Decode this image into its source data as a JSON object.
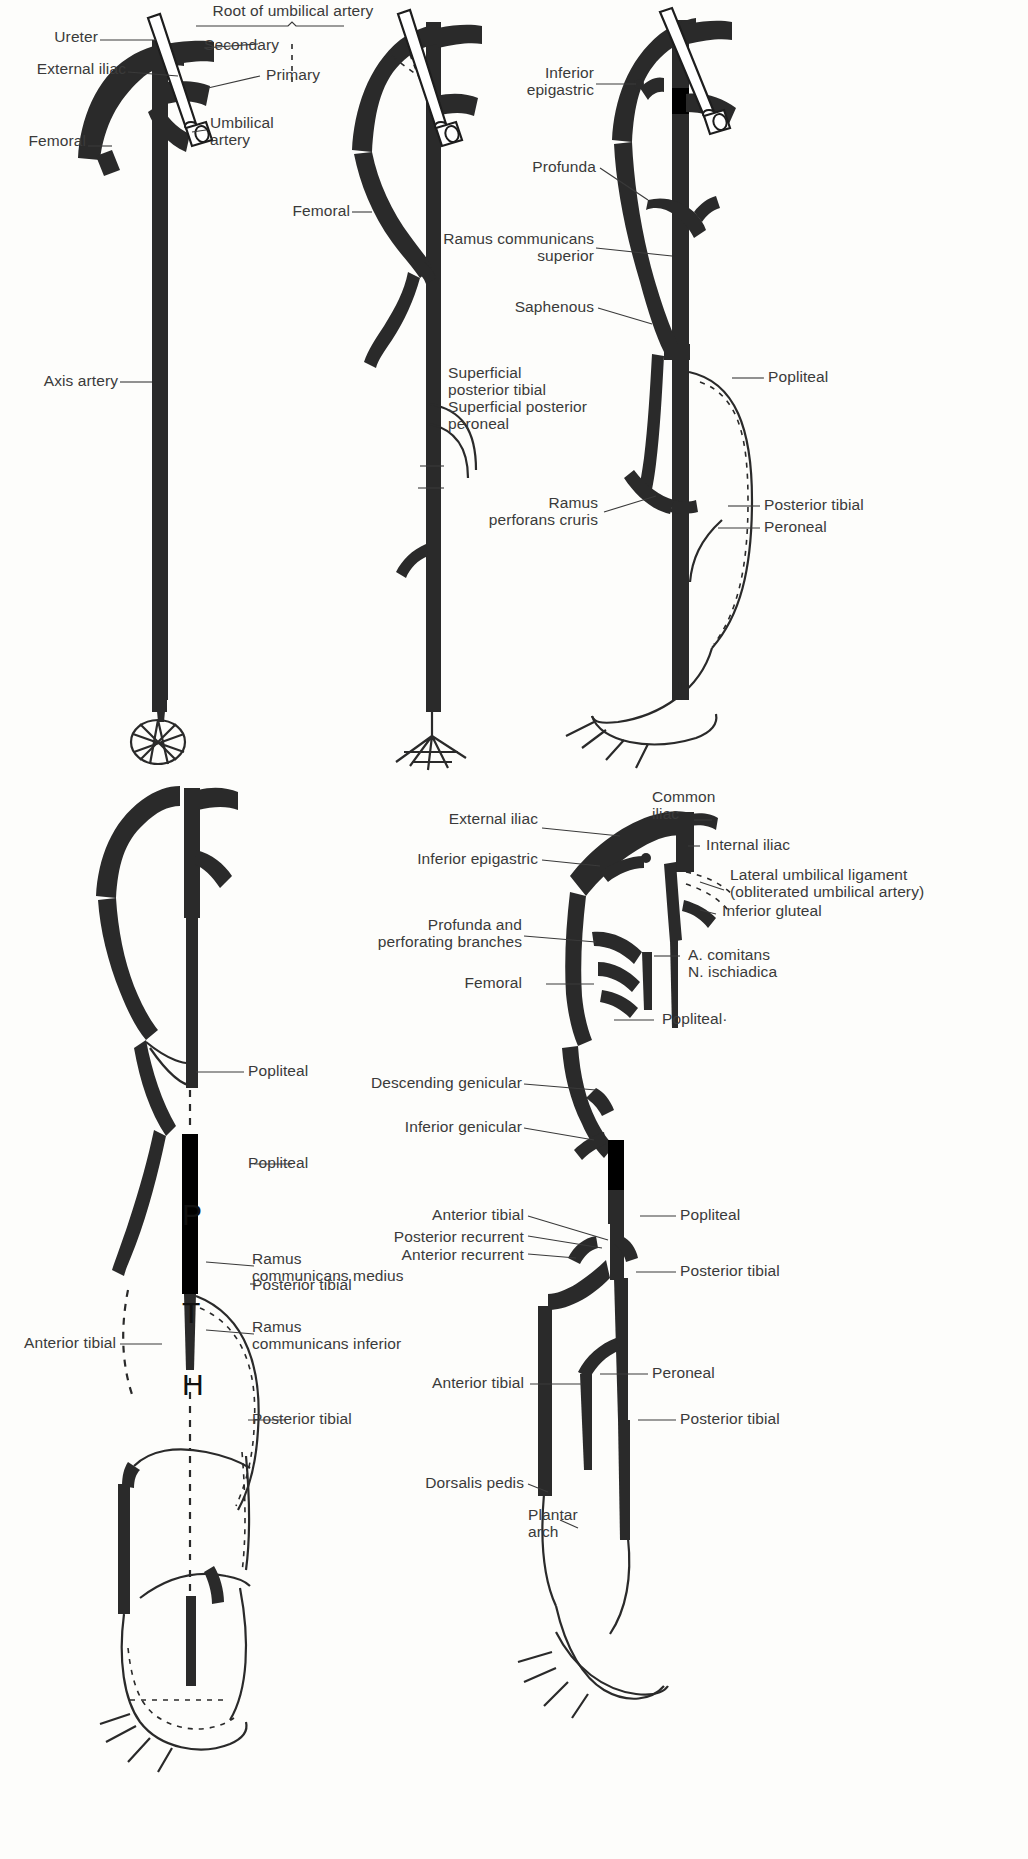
{
  "plate": {
    "title": "Development of the arteries of the lower limb",
    "ink_color": "#2a2a2a",
    "label_color": "#3a3a3a"
  },
  "panels": [
    {
      "id": "panel-1",
      "name": "axis-artery-stage",
      "labels": [
        {
          "key": "ureter",
          "text": "Ureter"
        },
        {
          "key": "external_iliac",
          "text": "External iliac"
        },
        {
          "key": "femoral",
          "text": "Femoral"
        },
        {
          "key": "axis_artery",
          "text": "Axis artery"
        },
        {
          "key": "umbilical_artery",
          "text": "Umbilical\nartery"
        },
        {
          "key": "root_of_umbilical_artery",
          "text": "Root of umbilical artery"
        },
        {
          "key": "secondary",
          "text": "Secondary"
        },
        {
          "key": "primary",
          "text": "Primary"
        }
      ]
    },
    {
      "id": "panel-2",
      "name": "superficial-branches-stage",
      "labels": [
        {
          "key": "femoral",
          "text": "Femoral"
        },
        {
          "key": "superficial_posterior_tibial",
          "text": "Superficial\nposterior tibial"
        },
        {
          "key": "superficial_posterior_peroneal",
          "text": "Superficial posterior\nperoneal"
        }
      ]
    },
    {
      "id": "panel-3",
      "name": "popliteal-stage",
      "labels": [
        {
          "key": "inferior_epigastric",
          "text": "Inferior\nepigastric"
        },
        {
          "key": "profunda",
          "text": "Profunda"
        },
        {
          "key": "ramus_communicans_superior",
          "text": "Ramus communicans\nsuperior"
        },
        {
          "key": "saphenous",
          "text": "Saphenous"
        },
        {
          "key": "ramus_perforans_cruris",
          "text": "Ramus\nperforans cruris"
        },
        {
          "key": "popliteal",
          "text": "Popliteal"
        },
        {
          "key": "posterior_tibial",
          "text": "Posterior tibial"
        },
        {
          "key": "peroneal",
          "text": "Peroneal"
        }
      ]
    },
    {
      "id": "panel-4",
      "name": "rami-communicantes-stage",
      "letters": [
        {
          "key": "p",
          "text": "P"
        },
        {
          "key": "t",
          "text": "T"
        },
        {
          "key": "h",
          "text": "H"
        }
      ],
      "labels": [
        {
          "key": "popliteal_upper",
          "text": "Popliteal"
        },
        {
          "key": "popliteal_lower",
          "text": "Popliteal"
        },
        {
          "key": "ramus_communicans_medius",
          "text": "Ramus\ncommunicans medius"
        },
        {
          "key": "posterior_tibial_upper",
          "text": "Posterior tibial"
        },
        {
          "key": "ramus_communicans_inferior",
          "text": "Ramus\ncommunicans inferior"
        },
        {
          "key": "anterior_tibial",
          "text": "Anterior tibial"
        },
        {
          "key": "posterior_tibial_lower",
          "text": "Posterior tibial"
        }
      ]
    },
    {
      "id": "panel-5",
      "name": "adult-pattern",
      "labels": [
        {
          "key": "external_iliac",
          "text": "External iliac"
        },
        {
          "key": "common_iliac",
          "text": "Common\niliac"
        },
        {
          "key": "inferior_epigastric",
          "text": "Inferior epigastric"
        },
        {
          "key": "internal_iliac",
          "text": "Internal iliac"
        },
        {
          "key": "lateral_umbilical_ligament",
          "text": "Lateral umbilical ligament\n(obliterated umbilical artery)"
        },
        {
          "key": "inferior_gluteal",
          "text": "Inferior gluteal"
        },
        {
          "key": "profunda_and_perforating",
          "text": "Profunda and\nperforating branches"
        },
        {
          "key": "a_comitans_n_ischiadica",
          "text": "A. comitans\nN. ischiadica"
        },
        {
          "key": "femoral",
          "text": "Femoral"
        },
        {
          "key": "popliteal_top",
          "text": "Popliteal·"
        },
        {
          "key": "descending_genicular",
          "text": "Descending genicular"
        },
        {
          "key": "inferior_genicular",
          "text": "Inferior genicular"
        },
        {
          "key": "anterior_tibial_upper",
          "text": "Anterior tibial"
        },
        {
          "key": "posterior_recurrent",
          "text": "Posterior recurrent"
        },
        {
          "key": "anterior_recurrent",
          "text": "Anterior recurrent"
        },
        {
          "key": "popliteal_right",
          "text": "Popliteal"
        },
        {
          "key": "posterior_tibial_right",
          "text": "Posterior tibial"
        },
        {
          "key": "anterior_tibial_lower",
          "text": "Anterior tibial"
        },
        {
          "key": "peroneal",
          "text": "Peroneal"
        },
        {
          "key": "posterior_tibial_lower_right",
          "text": "Posterior tibial"
        },
        {
          "key": "dorsalis_pedis",
          "text": "Dorsalis pedis"
        },
        {
          "key": "plantar_arch",
          "text": "Plantar\narch"
        }
      ]
    }
  ]
}
